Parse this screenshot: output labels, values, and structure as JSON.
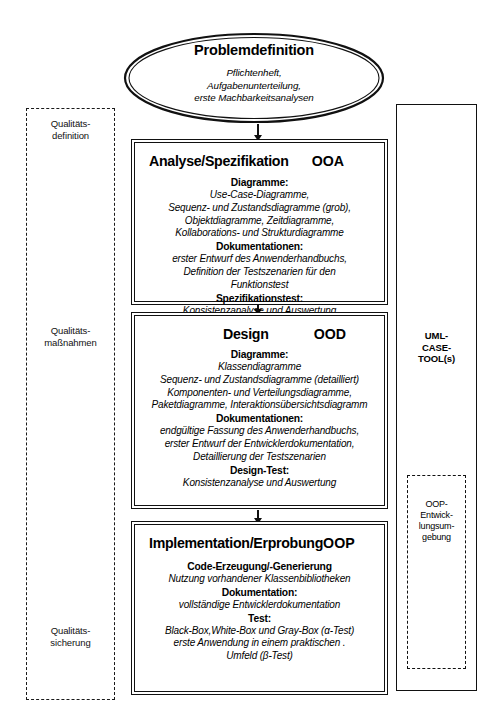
{
  "diagram": {
    "title": "Problemdefinition",
    "quality_column": {
      "labels": [
        {
          "id": "definition",
          "line1": "Qualitäts-",
          "line2": "definition"
        },
        {
          "id": "massnahmen",
          "line1": "Qualitäts-",
          "line2": "maßnahmen"
        },
        {
          "id": "sicherung",
          "line1": "Qualitäts-",
          "line2": "sicherung"
        }
      ]
    },
    "tool_column": {
      "label_line1": "UML-",
      "label_line2": "CASE-",
      "label_line3": "TOOL(s)",
      "oop_env_line1": "OOP-",
      "oop_env_line2": "Entwick-",
      "oop_env_line3": "lungsum-",
      "oop_env_line4": "gebung"
    },
    "problem": {
      "title": "Problemdefinition",
      "line1": "Pflichtenheft,",
      "line2": "Aufgabenunterteilung,",
      "line3": "erste Machbarkeitsanalysen"
    },
    "phases": [
      {
        "id": "analyse",
        "title": "Analyse/Spezifikation",
        "code": "OOA",
        "sections": [
          {
            "head": "Diagramme:",
            "lines": [
              "Use-Case-Diagramme,",
              "Sequenz- und Zustandsdiagramme (grob),",
              "Objektdiagramme, Zeitdiagramme,",
              "Kollaborations- und Strukturdiagramme"
            ]
          },
          {
            "head": "Dokumentationen:",
            "lines": [
              "erster Entwurf des Anwenderhandbuchs,",
              "Definition der Testszenarien für den",
              "Funktionstest"
            ]
          },
          {
            "head": "Spezifikationstest:",
            "lines": [
              "Konsistenzanalyse und Auswertung"
            ]
          }
        ]
      },
      {
        "id": "design",
        "title": "Design",
        "code": "OOD",
        "sections": [
          {
            "head": "Diagramme:",
            "lines": [
              "Klassendiagramme",
              "Sequenz- und Zustandsdiagramme (detailliert)",
              "Komponenten- und Verteilungsdiagramme,",
              "Paketdiagramme, Interaktionsübersichtsdiagramm"
            ]
          },
          {
            "head": "Dokumentationen:",
            "lines": [
              "endgültige Fassung des Anwenderhandbuchs,",
              "erster Entwurf der Entwicklerdokumentation,",
              "Detaillierung der Testszenarien"
            ]
          },
          {
            "head": "Design-Test:",
            "lines": [
              "Konsistenzanalyse und Auswertung"
            ]
          }
        ]
      },
      {
        "id": "implementation",
        "title": "Implementation/Erprobung",
        "code": "OOP",
        "sections": [
          {
            "head": "Code-Erzeugung/-Generierung",
            "lines": [
              "Nutzung vorhandener Klassenbibliotheken"
            ]
          },
          {
            "head": "Dokumentation:",
            "lines": [
              "vollständige Entwicklerdokumentation"
            ]
          },
          {
            "head": "Test:",
            "lines": [
              "Black-Box,White-Box und Gray-Box  (α-Test)",
              "erste Anwendung in einem praktischen .",
              "Umfeld (β-Test)"
            ]
          }
        ]
      }
    ],
    "colors": {
      "line": "#111111",
      "background": "#ffffff"
    }
  }
}
